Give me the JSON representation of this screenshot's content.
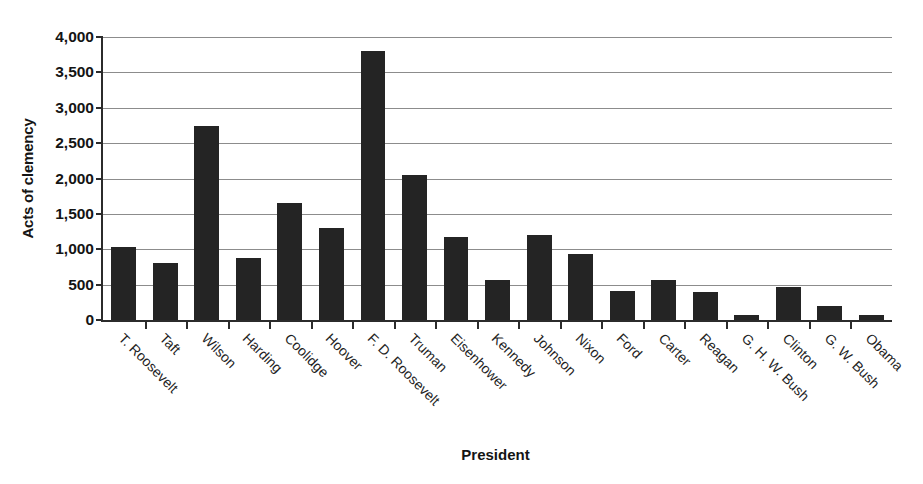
{
  "chart_data": {
    "type": "bar",
    "title": "",
    "xlabel": "President",
    "ylabel": "Acts of clemency",
    "ylim": [
      0,
      4000
    ],
    "ytick_values": [
      0,
      500,
      1000,
      1500,
      2000,
      2500,
      3000,
      3500,
      4000
    ],
    "ytick_labels": [
      "0",
      "500",
      "1,000",
      "1,500",
      "2,000",
      "2,500",
      "3,000",
      "3,500",
      "4,000"
    ],
    "grid": true,
    "legend": "none",
    "bar_color": "#242424",
    "categories": [
      "T. Roosevelt",
      "Taft",
      "Wilson",
      "Harding",
      "Coolidge",
      "Hoover",
      "F. D. Roosevelt",
      "Truman",
      "Eisenhower",
      "Kennedy",
      "Johnson",
      "Nixon",
      "Ford",
      "Carter",
      "Reagan",
      "G. H. W. Bush",
      "Clinton",
      "G. W. Bush",
      "Obama"
    ],
    "values": [
      1030,
      810,
      2740,
      880,
      1650,
      1300,
      3800,
      2050,
      1180,
      570,
      1200,
      940,
      410,
      570,
      400,
      77,
      460,
      200,
      64
    ]
  }
}
